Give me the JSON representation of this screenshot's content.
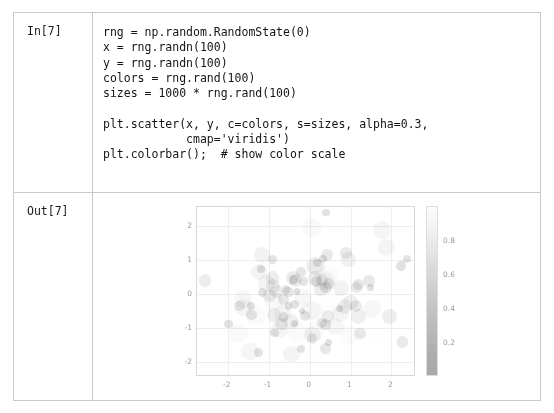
{
  "notebook": {
    "in_prompt": "In[7]",
    "out_prompt": "Out[7]",
    "code": "rng = np.random.RandomState(0)\nx = rng.randn(100)\ny = rng.randn(100)\ncolors = rng.rand(100)\nsizes = 1000 * rng.rand(100)\n\nplt.scatter(x, y, c=colors, s=sizes, alpha=0.3,\n            cmap='viridis')\nplt.colorbar();  # show color scale"
  },
  "chart_data": {
    "type": "scatter",
    "title": "",
    "xlabel": "",
    "ylabel": "",
    "xlim": [
      -2.75,
      2.6
    ],
    "ylim": [
      -2.45,
      2.55
    ],
    "xticks": [
      "-2",
      "-1",
      "0",
      "1",
      "2"
    ],
    "xtick_values": [
      -2,
      -1,
      0,
      1,
      2
    ],
    "yticks": [
      "2",
      "1",
      "0",
      "-1",
      "-2"
    ],
    "ytick_values": [
      2,
      1,
      0,
      -1,
      -2
    ],
    "grid": true,
    "legend": "none",
    "alpha": 0.3,
    "cmap": "viridis",
    "colorbar": {
      "ticks": [
        "0.8",
        "0.6",
        "0.4",
        "0.2"
      ],
      "tick_values": [
        0.8,
        0.6,
        0.4,
        0.2
      ],
      "vmin": 0.0,
      "vmax": 1.0,
      "position": "right"
    },
    "n_points": 100,
    "points": [
      {
        "x": 1.764,
        "y": 1.885,
        "c": 0.685,
        "s": 677
      },
      {
        "x": 0.4,
        "y": 0.175,
        "c": 0.204,
        "s": 275
      },
      {
        "x": 0.979,
        "y": -1.196,
        "c": 0.878,
        "s": 801
      },
      {
        "x": 2.241,
        "y": 0.813,
        "c": 0.027,
        "s": 198
      },
      {
        "x": 1.868,
        "y": 1.356,
        "c": 0.67,
        "s": 589
      },
      {
        "x": -0.977,
        "y": -0.072,
        "c": 0.417,
        "s": 322
      },
      {
        "x": 0.95,
        "y": 1.004,
        "c": 0.559,
        "s": 476
      },
      {
        "x": -0.151,
        "y": 0.362,
        "c": 0.14,
        "s": 154
      },
      {
        "x": -0.103,
        "y": -0.645,
        "c": 0.198,
        "s": 210
      },
      {
        "x": 0.411,
        "y": 0.361,
        "c": 0.801,
        "s": 725
      },
      {
        "x": 0.144,
        "y": -1.768,
        "c": 0.968,
        "s": 889
      },
      {
        "x": 1.454,
        "y": 0.379,
        "c": 0.313,
        "s": 268
      },
      {
        "x": 0.761,
        "y": -0.59,
        "c": 0.692,
        "s": 612
      },
      {
        "x": 0.122,
        "y": -1.105,
        "c": 0.876,
        "s": 755
      },
      {
        "x": 0.444,
        "y": 0.551,
        "c": 0.895,
        "s": 832
      },
      {
        "x": 0.334,
        "y": 1.019,
        "c": 0.085,
        "s": 126
      },
      {
        "x": 1.494,
        "y": 0.169,
        "c": 0.039,
        "s": 104
      },
      {
        "x": -0.205,
        "y": 0.65,
        "c": 0.17,
        "s": 199
      },
      {
        "x": 0.313,
        "y": 0.426,
        "c": 0.878,
        "s": 794
      },
      {
        "x": -0.854,
        "y": -1.15,
        "c": 0.098,
        "s": 142
      },
      {
        "x": -2.553,
        "y": 0.384,
        "c": 0.421,
        "s": 315
      },
      {
        "x": 0.654,
        "y": -0.349,
        "c": 0.958,
        "s": 866
      },
      {
        "x": 0.864,
        "y": -0.38,
        "c": 0.533,
        "s": 455
      },
      {
        "x": -0.742,
        "y": -1.049,
        "c": 0.692,
        "s": 604
      },
      {
        "x": 2.27,
        "y": -1.421,
        "c": 0.316,
        "s": 288
      },
      {
        "x": -1.454,
        "y": -1.706,
        "c": 0.687,
        "s": 611
      },
      {
        "x": 0.046,
        "y": 1.951,
        "c": 0.835,
        "s": 742
      },
      {
        "x": -0.187,
        "y": -0.51,
        "c": 0.018,
        "s": 92
      },
      {
        "x": 1.533,
        "y": -0.438,
        "c": 0.75,
        "s": 668
      },
      {
        "x": 1.469,
        "y": -1.253,
        "c": 0.989,
        "s": 920
      },
      {
        "x": 0.155,
        "y": 0.778,
        "c": 0.748,
        "s": 659
      },
      {
        "x": 0.378,
        "y": -1.614,
        "c": 0.28,
        "s": 254
      },
      {
        "x": -0.888,
        "y": -0.212,
        "c": 0.789,
        "s": 701
      },
      {
        "x": -1.981,
        "y": -0.896,
        "c": 0.103,
        "s": 151
      },
      {
        "x": -0.348,
        "y": 0.386,
        "c": 0.448,
        "s": 383
      },
      {
        "x": 0.156,
        "y": -0.511,
        "c": 0.909,
        "s": 811
      },
      {
        "x": 1.23,
        "y": -1.181,
        "c": 0.294,
        "s": 261
      },
      {
        "x": 1.202,
        "y": 0.281,
        "c": 0.287,
        "s": 245
      },
      {
        "x": -0.387,
        "y": 0.428,
        "c": 0.13,
        "s": 168
      },
      {
        "x": -0.302,
        "y": 0.067,
        "c": 0.019,
        "s": 85
      },
      {
        "x": -1.048,
        "y": 0.302,
        "c": 0.678,
        "s": 597
      },
      {
        "x": -1.42,
        "y": -0.635,
        "c": 0.211,
        "s": 222
      },
      {
        "x": -1.706,
        "y": -0.363,
        "c": 0.265,
        "s": 238
      },
      {
        "x": 1.951,
        "y": -0.672,
        "c": 0.491,
        "s": 417
      },
      {
        "x": -0.51,
        "y": -0.36,
        "c": 0.054,
        "s": 113
      },
      {
        "x": -0.438,
        "y": -0.813,
        "c": 0.574,
        "s": 499
      },
      {
        "x": -1.253,
        "y": -1.726,
        "c": 0.147,
        "s": 176
      },
      {
        "x": 0.778,
        "y": 0.177,
        "c": 0.589,
        "s": 521
      },
      {
        "x": -1.614,
        "y": -0.402,
        "c": 0.7,
        "s": 631
      },
      {
        "x": -0.213,
        "y": -1.631,
        "c": 0.103,
        "s": 148
      },
      {
        "x": -0.895,
        "y": 0.462,
        "c": 0.419,
        "s": 358
      },
      {
        "x": 0.386,
        "y": -0.907,
        "c": 0.227,
        "s": 232
      },
      {
        "x": -0.511,
        "y": 0.051,
        "c": 0.255,
        "s": 241
      },
      {
        "x": -1.181,
        "y": 0.729,
        "c": 0.058,
        "s": 119
      },
      {
        "x": 0.281,
        "y": 0.129,
        "c": 0.434,
        "s": 366
      },
      {
        "x": 0.428,
        "y": 1.139,
        "c": 0.311,
        "s": 272
      },
      {
        "x": 0.067,
        "y": -1.234,
        "c": 0.698,
        "s": 624
      },
      {
        "x": 0.302,
        "y": 0.402,
        "c": 0.377,
        "s": 331
      },
      {
        "x": -0.635,
        "y": -0.684,
        "c": 0.18,
        "s": 193
      },
      {
        "x": -0.363,
        "y": -0.87,
        "c": 0.024,
        "s": 98
      },
      {
        "x": -0.672,
        "y": -0.578,
        "c": 0.679,
        "s": 606
      },
      {
        "x": -0.36,
        "y": -0.311,
        "c": 0.137,
        "s": 163
      },
      {
        "x": -0.813,
        "y": 0.056,
        "c": 0.392,
        "s": 344
      },
      {
        "x": -1.726,
        "y": -1.165,
        "c": 0.823,
        "s": 735
      },
      {
        "x": 0.177,
        "y": 0.901,
        "c": 0.097,
        "s": 136
      },
      {
        "x": -0.402,
        "y": 0.466,
        "c": 0.441,
        "s": 372
      },
      {
        "x": -1.631,
        "y": -0.154,
        "c": 0.73,
        "s": 652
      },
      {
        "x": 0.462,
        "y": 0.299,
        "c": 0.252,
        "s": 228
      },
      {
        "x": -0.907,
        "y": 0.992,
        "c": 0.141,
        "s": 170
      },
      {
        "x": 0.051,
        "y": -0.509,
        "c": 0.804,
        "s": 714
      },
      {
        "x": 0.729,
        "y": -0.438,
        "c": 0.07,
        "s": 122
      },
      {
        "x": 0.129,
        "y": 0.45,
        "c": 0.518,
        "s": 443
      },
      {
        "x": 1.139,
        "y": 0.17,
        "c": 0.296,
        "s": 258
      },
      {
        "x": -1.234,
        "y": 0.636,
        "c": 0.622,
        "s": 548
      },
      {
        "x": 0.402,
        "y": 2.386,
        "c": 0.082,
        "s": 129
      },
      {
        "x": -0.684,
        "y": -0.887,
        "c": 0.367,
        "s": 318
      },
      {
        "x": -0.87,
        "y": -0.636,
        "c": 0.457,
        "s": 389
      },
      {
        "x": -0.578,
        "y": 0.118,
        "c": 0.126,
        "s": 158
      },
      {
        "x": -0.311,
        "y": -1.144,
        "c": 0.87,
        "s": 776
      },
      {
        "x": 0.056,
        "y": -1.31,
        "c": 0.232,
        "s": 216
      },
      {
        "x": -1.165,
        "y": 1.134,
        "c": 0.599,
        "s": 530
      },
      {
        "x": 0.901,
        "y": 1.19,
        "c": 0.345,
        "s": 300
      },
      {
        "x": 0.466,
        "y": -1.429,
        "c": 0.048,
        "s": 108
      },
      {
        "x": -0.154,
        "y": -0.141,
        "c": 0.77,
        "s": 683
      },
      {
        "x": 0.299,
        "y": -0.861,
        "c": 0.19,
        "s": 205
      },
      {
        "x": 0.992,
        "y": -0.255,
        "c": 0.527,
        "s": 450
      },
      {
        "x": -0.509,
        "y": -2.798,
        "c": 0.064,
        "s": 117
      },
      {
        "x": -0.438,
        "y": -1.772,
        "c": 0.655,
        "s": 575
      },
      {
        "x": 0.45,
        "y": -0.682,
        "c": 0.399,
        "s": 340
      },
      {
        "x": 0.17,
        "y": 0.366,
        "c": 0.247,
        "s": 225
      },
      {
        "x": 0.636,
        "y": -0.967,
        "c": 0.716,
        "s": 640
      },
      {
        "x": 2.386,
        "y": 1.028,
        "c": 0.119,
        "s": 145
      },
      {
        "x": -0.887,
        "y": 0.228,
        "c": 0.486,
        "s": 411
      },
      {
        "x": -0.636,
        "y": -0.165,
        "c": 0.288,
        "s": 250
      },
      {
        "x": 0.118,
        "y": 0.827,
        "c": 0.632,
        "s": 559
      },
      {
        "x": -1.144,
        "y": 0.03,
        "c": 0.155,
        "s": 181
      },
      {
        "x": -1.31,
        "y": -0.634,
        "c": 0.849,
        "s": 760
      },
      {
        "x": 1.134,
        "y": -0.362,
        "c": 0.354,
        "s": 310
      },
      {
        "x": 1.19,
        "y": -0.672,
        "c": 0.509,
        "s": 436
      },
      {
        "x": -1.429,
        "y": -0.36,
        "c": 0.078,
        "s": 131
      }
    ]
  }
}
